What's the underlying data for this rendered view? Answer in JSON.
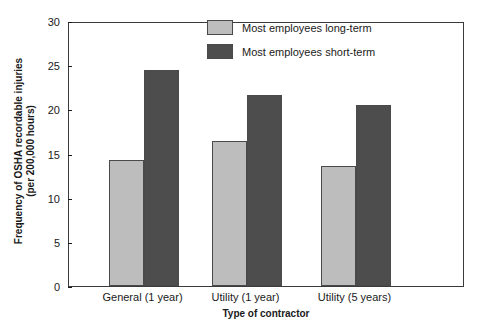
{
  "chart_data": {
    "type": "bar",
    "title": "",
    "xlabel": "Type of contractor",
    "ylabel_line1": "Frequency of OSHA recordable injuries",
    "ylabel_line2": "(per 200,000 hours)",
    "categories": [
      "General (1 year)",
      "Utility (1 year)",
      "Utility (5 years)"
    ],
    "series": [
      {
        "name": "Most employees long-term",
        "color": "#bdbdbd",
        "values": [
          14.3,
          16.4,
          13.6
        ]
      },
      {
        "name": "Most employees short-term",
        "color": "#4d4d4d",
        "values": [
          24.4,
          21.6,
          20.5
        ]
      }
    ],
    "ylim": [
      0,
      30
    ],
    "yticks": [
      0,
      5,
      10,
      15,
      20,
      25,
      30
    ],
    "ytick_labels": [
      "0",
      "5",
      "10",
      "15",
      "20",
      "25",
      "30"
    ],
    "grid": false,
    "legend_position": "top-center-right",
    "frame": true
  }
}
